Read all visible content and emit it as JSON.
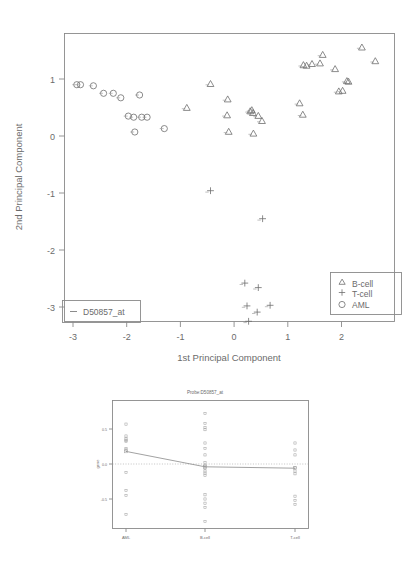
{
  "figure": {
    "kind": "pca-scatter-with-profile-panel",
    "probe_id": "D50857_at"
  },
  "main_plot": {
    "xlabel": "1st Principal Component",
    "ylabel": "2nd Principal Component",
    "xticks": [
      "-3",
      "-2",
      "-1",
      "0",
      "1",
      "2"
    ],
    "yticks": [
      "1",
      "0",
      "-1",
      "-2",
      "-3"
    ],
    "legend": {
      "items": [
        {
          "label": "B-cell",
          "symbol": "triangle"
        },
        {
          "label": "T-cell",
          "symbol": "plus"
        },
        {
          "label": "AML",
          "symbol": "circle"
        }
      ]
    },
    "probe_legend": {
      "label": "D50857_at",
      "symbol": "dash"
    }
  },
  "bottom_plot": {
    "title": "Probe:D50857_at",
    "ylabel": "gene",
    "xticks": [
      "AML",
      "B-cell",
      "T-cell"
    ],
    "yticks": [
      "0.5",
      "0.0",
      "-0.5"
    ]
  },
  "chart_data": [
    {
      "type": "scatter",
      "title": "",
      "xlabel": "1st Principal Component",
      "ylabel": "2nd Principal Component",
      "xlim": [
        -3.25,
        2.9
      ],
      "ylim": [
        -3.45,
        1.75
      ],
      "grid": false,
      "legend_position": "bottom-right",
      "series": [
        {
          "name": "AML",
          "symbol": "circle",
          "points": [
            [
              -2.93,
              0.9
            ],
            [
              -2.86,
              0.9
            ],
            [
              -2.62,
              0.88
            ],
            [
              -2.43,
              0.75
            ],
            [
              -2.25,
              0.75
            ],
            [
              -2.11,
              0.67
            ],
            [
              -1.97,
              0.35
            ],
            [
              -1.87,
              0.33
            ],
            [
              -1.85,
              0.07
            ],
            [
              -1.76,
              0.72
            ],
            [
              -1.72,
              0.33
            ],
            [
              -1.62,
              0.33
            ],
            [
              -1.3,
              0.13
            ]
          ]
        },
        {
          "name": "B-cell",
          "symbol": "triangle",
          "points": [
            [
              -0.88,
              0.5
            ],
            [
              -0.44,
              0.92
            ],
            [
              -0.12,
              0.65
            ],
            [
              -0.13,
              0.37
            ],
            [
              -0.1,
              0.08
            ],
            [
              0.3,
              0.44
            ],
            [
              0.33,
              0.46
            ],
            [
              0.35,
              0.41
            ],
            [
              0.36,
              0.05
            ],
            [
              0.45,
              0.36
            ],
            [
              0.52,
              0.27
            ],
            [
              1.22,
              0.58
            ],
            [
              1.28,
              0.38
            ],
            [
              1.29,
              1.25
            ],
            [
              1.35,
              1.24
            ],
            [
              1.45,
              1.27
            ],
            [
              1.6,
              1.28
            ],
            [
              1.65,
              1.43
            ],
            [
              1.88,
              1.18
            ],
            [
              1.95,
              0.79
            ],
            [
              2.02,
              0.8
            ],
            [
              2.1,
              0.97
            ],
            [
              2.13,
              0.96
            ],
            [
              2.38,
              1.56
            ],
            [
              2.63,
              1.32
            ]
          ]
        },
        {
          "name": "T-cell",
          "symbol": "plus",
          "points": [
            [
              -0.44,
              -0.96
            ],
            [
              0.53,
              -1.45
            ],
            [
              0.2,
              -2.58
            ],
            [
              0.45,
              -2.66
            ],
            [
              0.24,
              -2.98
            ],
            [
              0.67,
              -2.97
            ],
            [
              0.43,
              -3.09
            ],
            [
              0.27,
              -3.25
            ]
          ]
        }
      ]
    },
    {
      "type": "strip",
      "title": "Probe:D50857_at",
      "xlabel": "",
      "ylabel": "gene",
      "categories": [
        "AML",
        "B-cell",
        "T-cell"
      ],
      "ylim": [
        -0.95,
        0.85
      ],
      "yticks": [
        0.5,
        0.0,
        -0.5
      ],
      "grid": false,
      "reference_line": 0.0,
      "group_means": [
        0.18,
        -0.04,
        -0.06
      ],
      "series": [
        {
          "name": "AML",
          "values": [
            0.57,
            0.4,
            0.36,
            0.34,
            0.32,
            0.22,
            0.2,
            -0.12,
            -0.38,
            -0.45,
            -0.72
          ]
        },
        {
          "name": "B-cell",
          "values": [
            0.72,
            0.58,
            0.52,
            0.49,
            0.3,
            0.22,
            0.13,
            0.02,
            -0.02,
            -0.06,
            -0.1,
            -0.13,
            -0.16,
            -0.44,
            -0.5,
            -0.56,
            -0.62,
            -0.82
          ]
        },
        {
          "name": "T-cell",
          "values": [
            0.3,
            0.2,
            0.13,
            -0.05,
            -0.1,
            -0.14,
            -0.46,
            -0.52,
            -0.58
          ]
        }
      ]
    }
  ]
}
